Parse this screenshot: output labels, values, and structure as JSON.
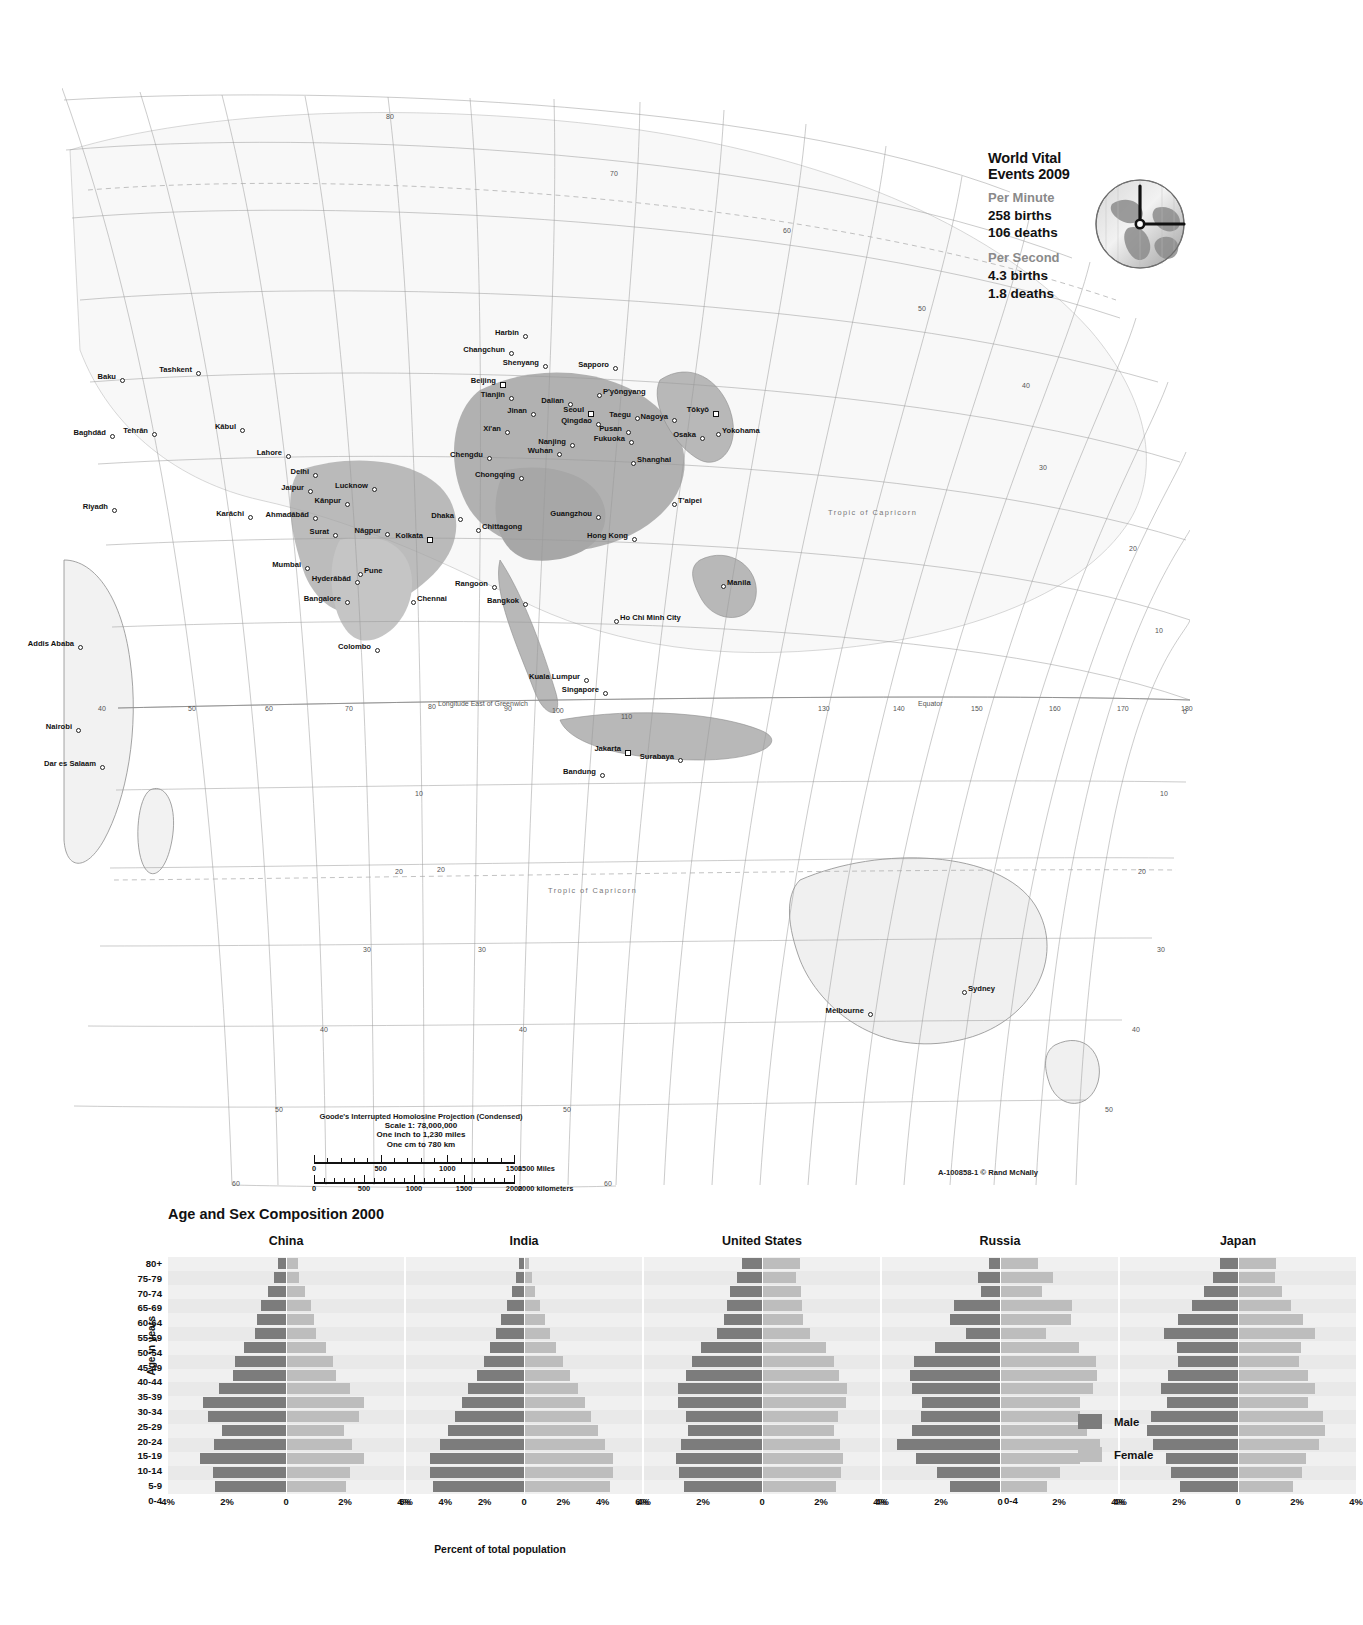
{
  "vital_events": {
    "title": "World Vital Events 2009",
    "groups": [
      {
        "heading": "Per Minute",
        "lines": [
          "258 births",
          "106 deaths"
        ]
      },
      {
        "heading": "Per Second",
        "lines": [
          "4.3 births",
          "1.8 deaths"
        ]
      }
    ],
    "globe_icon": "globe-clock-icon"
  },
  "map": {
    "projection_note": "Goode's Interrupted Homolosine Projection (Condensed)",
    "scale_lines": [
      "Scale 1: 78,000,000",
      "One inch to 1,230 miles",
      "One cm to 780 km"
    ],
    "ruler_miles": {
      "labels": [
        "0",
        "500",
        "1000",
        "1500"
      ],
      "unit": "1500 Miles"
    },
    "ruler_km": {
      "labels": [
        "0",
        "500",
        "1000",
        "1500",
        "2000"
      ],
      "unit": "2000 kilometers"
    },
    "credit_code": "A-100858-1",
    "credit_publisher": "Rand McNally",
    "longitude_label": "Longitude East of Greenwich",
    "equator_label": "Equator",
    "tropic_capricorn_label": "Tropic  of  Capricorn",
    "tropic_cancer_label": "Tropic  of  Capricorn",
    "cities": [
      {
        "name": "Baku",
        "x": 120,
        "y": 378,
        "anchor": "right",
        "marker": "dot"
      },
      {
        "name": "Tashkent",
        "x": 196,
        "y": 371,
        "anchor": "right",
        "marker": "dot"
      },
      {
        "name": "Tehrān",
        "x": 152,
        "y": 432,
        "anchor": "right",
        "marker": "dot"
      },
      {
        "name": "Baghdād",
        "x": 110,
        "y": 434,
        "anchor": "right",
        "marker": "dot"
      },
      {
        "name": "Kābul",
        "x": 240,
        "y": 428,
        "anchor": "right",
        "marker": "dot"
      },
      {
        "name": "Riyadh",
        "x": 112,
        "y": 508,
        "anchor": "right",
        "marker": "dot"
      },
      {
        "name": "Karāchi",
        "x": 248,
        "y": 515,
        "anchor": "right",
        "marker": "dot"
      },
      {
        "name": "Lahore",
        "x": 286,
        "y": 454,
        "anchor": "right",
        "marker": "dot"
      },
      {
        "name": "Delhi",
        "x": 313,
        "y": 473,
        "anchor": "right",
        "marker": "dot"
      },
      {
        "name": "Jaipur",
        "x": 308,
        "y": 489,
        "anchor": "right",
        "marker": "dot"
      },
      {
        "name": "Lucknow",
        "x": 372,
        "y": 487,
        "anchor": "right",
        "marker": "dot"
      },
      {
        "name": "Kānpur",
        "x": 345,
        "y": 502,
        "anchor": "right",
        "marker": "dot"
      },
      {
        "name": "Ahmadābād",
        "x": 313,
        "y": 516,
        "anchor": "right",
        "marker": "dot"
      },
      {
        "name": "Surat",
        "x": 333,
        "y": 533,
        "anchor": "right",
        "marker": "dot"
      },
      {
        "name": "Nāgpur",
        "x": 385,
        "y": 532,
        "anchor": "right",
        "marker": "dot"
      },
      {
        "name": "Kolkata",
        "x": 427,
        "y": 537,
        "anchor": "right",
        "marker": "square"
      },
      {
        "name": "Dhaka",
        "x": 458,
        "y": 517,
        "anchor": "right",
        "marker": "dot"
      },
      {
        "name": "Chittagong",
        "x": 476,
        "y": 528,
        "anchor": "left",
        "marker": "dot"
      },
      {
        "name": "Mumbai",
        "x": 305,
        "y": 566,
        "anchor": "right",
        "marker": "dot"
      },
      {
        "name": "Pune",
        "x": 358,
        "y": 572,
        "anchor": "left",
        "marker": "dot"
      },
      {
        "name": "Hyderābād",
        "x": 355,
        "y": 580,
        "anchor": "right",
        "marker": "dot"
      },
      {
        "name": "Bangalore",
        "x": 345,
        "y": 600,
        "anchor": "right",
        "marker": "dot"
      },
      {
        "name": "Chennai",
        "x": 411,
        "y": 600,
        "anchor": "left",
        "marker": "dot"
      },
      {
        "name": "Colombo",
        "x": 375,
        "y": 648,
        "anchor": "right",
        "marker": "dot"
      },
      {
        "name": "Harbin",
        "x": 523,
        "y": 334,
        "anchor": "right",
        "marker": "dot"
      },
      {
        "name": "Changchun",
        "x": 509,
        "y": 351,
        "anchor": "right",
        "marker": "dot"
      },
      {
        "name": "Shenyang",
        "x": 543,
        "y": 364,
        "anchor": "right",
        "marker": "dot"
      },
      {
        "name": "Sapporo",
        "x": 613,
        "y": 366,
        "anchor": "right",
        "marker": "dot"
      },
      {
        "name": "Beijing",
        "x": 500,
        "y": 382,
        "anchor": "right",
        "marker": "square"
      },
      {
        "name": "Tianjin",
        "x": 509,
        "y": 396,
        "anchor": "right",
        "marker": "dot"
      },
      {
        "name": "Dalian",
        "x": 568,
        "y": 402,
        "anchor": "right",
        "marker": "dot"
      },
      {
        "name": "P'yŏngyang",
        "x": 597,
        "y": 393,
        "anchor": "left",
        "marker": "dot"
      },
      {
        "name": "Jinan",
        "x": 531,
        "y": 412,
        "anchor": "right",
        "marker": "dot"
      },
      {
        "name": "Seoul",
        "x": 588,
        "y": 411,
        "anchor": "right",
        "marker": "square"
      },
      {
        "name": "Qingdao",
        "x": 596,
        "y": 422,
        "anchor": "right",
        "marker": "dot"
      },
      {
        "name": "Taegu",
        "x": 635,
        "y": 416,
        "anchor": "right",
        "marker": "dot"
      },
      {
        "name": "Nagoya",
        "x": 672,
        "y": 418,
        "anchor": "right",
        "marker": "dot"
      },
      {
        "name": "Tōkyō",
        "x": 713,
        "y": 411,
        "anchor": "right",
        "marker": "square"
      },
      {
        "name": "Pusan",
        "x": 626,
        "y": 430,
        "anchor": "right",
        "marker": "dot"
      },
      {
        "name": "Fukuoka",
        "x": 629,
        "y": 440,
        "anchor": "right",
        "marker": "dot"
      },
      {
        "name": "Osaka",
        "x": 700,
        "y": 436,
        "anchor": "right",
        "marker": "dot"
      },
      {
        "name": "Yokohama",
        "x": 716,
        "y": 432,
        "anchor": "left",
        "marker": "dot"
      },
      {
        "name": "Xi'an",
        "x": 505,
        "y": 430,
        "anchor": "right",
        "marker": "dot"
      },
      {
        "name": "Nanjing",
        "x": 570,
        "y": 443,
        "anchor": "right",
        "marker": "dot"
      },
      {
        "name": "Chengdu",
        "x": 487,
        "y": 456,
        "anchor": "right",
        "marker": "dot"
      },
      {
        "name": "Wuhan",
        "x": 557,
        "y": 452,
        "anchor": "right",
        "marker": "dot"
      },
      {
        "name": "Shanghai",
        "x": 631,
        "y": 461,
        "anchor": "left",
        "marker": "dot"
      },
      {
        "name": "Chongqing",
        "x": 519,
        "y": 476,
        "anchor": "right",
        "marker": "dot"
      },
      {
        "name": "Guangzhou",
        "x": 596,
        "y": 515,
        "anchor": "right",
        "marker": "dot"
      },
      {
        "name": "T'aipei",
        "x": 672,
        "y": 502,
        "anchor": "left",
        "marker": "dot"
      },
      {
        "name": "Hong Kong",
        "x": 632,
        "y": 537,
        "anchor": "right",
        "marker": "dot"
      },
      {
        "name": "Rangoon",
        "x": 492,
        "y": 585,
        "anchor": "right",
        "marker": "dot"
      },
      {
        "name": "Bangkok",
        "x": 523,
        "y": 602,
        "anchor": "right",
        "marker": "dot"
      },
      {
        "name": "Ho Chi Minh City",
        "x": 614,
        "y": 619,
        "anchor": "left",
        "marker": "dot"
      },
      {
        "name": "Manila",
        "x": 721,
        "y": 584,
        "anchor": "left",
        "marker": "dot"
      },
      {
        "name": "Kuala Lumpur",
        "x": 584,
        "y": 678,
        "anchor": "right",
        "marker": "dot"
      },
      {
        "name": "Singapore",
        "x": 603,
        "y": 691,
        "anchor": "right",
        "marker": "dot"
      },
      {
        "name": "Jakarta",
        "x": 625,
        "y": 750,
        "anchor": "right",
        "marker": "square"
      },
      {
        "name": "Bandung",
        "x": 600,
        "y": 773,
        "anchor": "right",
        "marker": "dot"
      },
      {
        "name": "Surabaya",
        "x": 678,
        "y": 758,
        "anchor": "right",
        "marker": "dot"
      },
      {
        "name": "Addis Ababa",
        "x": 78,
        "y": 645,
        "anchor": "right",
        "marker": "dot"
      },
      {
        "name": "Nairobi",
        "x": 76,
        "y": 728,
        "anchor": "right",
        "marker": "dot"
      },
      {
        "name": "Dar es Salaam",
        "x": 100,
        "y": 765,
        "anchor": "right",
        "marker": "dot"
      },
      {
        "name": "Sydney",
        "x": 962,
        "y": 990,
        "anchor": "left",
        "marker": "dot"
      },
      {
        "name": "Melbourne",
        "x": 868,
        "y": 1012,
        "anchor": "right",
        "marker": "dot"
      }
    ],
    "graticule_labels": [
      {
        "text": "80",
        "x": 386,
        "y": 113
      },
      {
        "text": "70",
        "x": 610,
        "y": 170
      },
      {
        "text": "60",
        "x": 783,
        "y": 227
      },
      {
        "text": "50",
        "x": 918,
        "y": 305
      },
      {
        "text": "40",
        "x": 1022,
        "y": 382
      },
      {
        "text": "30",
        "x": 1039,
        "y": 464
      },
      {
        "text": "20",
        "x": 1129,
        "y": 545
      },
      {
        "text": "10",
        "x": 1155,
        "y": 627
      },
      {
        "text": "0",
        "x": 1183,
        "y": 708
      },
      {
        "text": "10",
        "x": 1160,
        "y": 790
      },
      {
        "text": "20",
        "x": 1138,
        "y": 868
      },
      {
        "text": "30",
        "x": 1157,
        "y": 946
      },
      {
        "text": "40",
        "x": 1132,
        "y": 1026
      },
      {
        "text": "50",
        "x": 1105,
        "y": 1106
      },
      {
        "text": "40",
        "x": 98,
        "y": 705
      },
      {
        "text": "50",
        "x": 188,
        "y": 705
      },
      {
        "text": "60",
        "x": 265,
        "y": 705
      },
      {
        "text": "70",
        "x": 345,
        "y": 705
      },
      {
        "text": "80",
        "x": 428,
        "y": 703
      },
      {
        "text": "90",
        "x": 504,
        "y": 705
      },
      {
        "text": "100",
        "x": 552,
        "y": 707
      },
      {
        "text": "110",
        "x": 621,
        "y": 713
      },
      {
        "text": "130",
        "x": 818,
        "y": 705
      },
      {
        "text": "140",
        "x": 893,
        "y": 705
      },
      {
        "text": "150",
        "x": 971,
        "y": 705
      },
      {
        "text": "160",
        "x": 1049,
        "y": 705
      },
      {
        "text": "170",
        "x": 1117,
        "y": 705
      },
      {
        "text": "180",
        "x": 1181,
        "y": 705
      },
      {
        "text": "10",
        "x": 415,
        "y": 790
      },
      {
        "text": "20",
        "x": 395,
        "y": 868
      },
      {
        "text": "20",
        "x": 437,
        "y": 866
      },
      {
        "text": "30",
        "x": 363,
        "y": 946
      },
      {
        "text": "30",
        "x": 478,
        "y": 946
      },
      {
        "text": "40",
        "x": 320,
        "y": 1026
      },
      {
        "text": "40",
        "x": 519,
        "y": 1026
      },
      {
        "text": "50",
        "x": 275,
        "y": 1106
      },
      {
        "text": "50",
        "x": 563,
        "y": 1106
      },
      {
        "text": "60",
        "x": 232,
        "y": 1180
      },
      {
        "text": "60",
        "x": 604,
        "y": 1180
      }
    ]
  },
  "chart_data": {
    "type": "bar",
    "title": "Age and Sex Composition 2000",
    "xlabel": "Percent of total population",
    "ylabel": "Age in years",
    "legend": [
      {
        "label": "Male",
        "color": "#7c7c7c"
      },
      {
        "label": "Female",
        "color": "#bdbdbd"
      }
    ],
    "legend_position": "right",
    "categories": [
      "80+",
      "75-79",
      "70-74",
      "65-69",
      "60-64",
      "55-59",
      "50-54",
      "45-49",
      "40-44",
      "35-39",
      "30-34",
      "25-29",
      "20-24",
      "15-19",
      "10-14",
      "5-9",
      "0-4"
    ],
    "panels": [
      {
        "name": "China",
        "xticks": [
          "4%",
          "2%",
          "0",
          "2%",
          "4%"
        ],
        "xlim": 5.0,
        "series": [
          {
            "name": "Male",
            "values": [
              0.35,
              0.5,
              0.75,
              1.05,
              1.25,
              1.3,
              1.8,
              2.15,
              2.25,
              2.85,
              3.5,
              3.3,
              2.7,
              3.05,
              3.65,
              3.1,
              3.0
            ]
          },
          {
            "name": "Female",
            "values": [
              0.5,
              0.55,
              0.8,
              1.05,
              1.2,
              1.25,
              1.7,
              2.0,
              2.1,
              2.7,
              3.3,
              3.1,
              2.45,
              2.8,
              3.3,
              2.7,
              2.55
            ]
          }
        ]
      },
      {
        "name": "India",
        "xticks": [
          "6%",
          "4%",
          "2%",
          "0",
          "2%",
          "4%",
          "6%"
        ],
        "xlim": 7.0,
        "series": [
          {
            "name": "Male",
            "values": [
              0.3,
              0.45,
              0.7,
              1.0,
              1.35,
              1.65,
              2.0,
              2.4,
              2.8,
              3.3,
              3.7,
              4.1,
              4.5,
              5.0,
              5.6,
              5.6,
              5.4
            ]
          },
          {
            "name": "Female",
            "values": [
              0.3,
              0.45,
              0.65,
              0.95,
              1.25,
              1.55,
              1.9,
              2.3,
              2.7,
              3.2,
              3.6,
              4.0,
              4.4,
              4.8,
              5.3,
              5.3,
              5.1
            ]
          }
        ]
      },
      {
        "name": "United States",
        "xticks": [
          "4%",
          "2%",
          "0",
          "2%",
          "4%"
        ],
        "xlim": 5.0,
        "series": [
          {
            "name": "Male",
            "values": [
              0.85,
              1.05,
              1.35,
              1.5,
              1.6,
              1.9,
              2.6,
              2.95,
              3.2,
              3.55,
              3.55,
              3.2,
              3.15,
              3.45,
              3.65,
              3.5,
              3.3
            ]
          },
          {
            "name": "Female",
            "values": [
              1.6,
              1.45,
              1.65,
              1.7,
              1.75,
              2.05,
              2.7,
              3.05,
              3.25,
              3.6,
              3.55,
              3.2,
              3.05,
              3.3,
              3.45,
              3.35,
              3.15
            ]
          }
        ]
      },
      {
        "name": "Russia",
        "xticks": [
          "4%",
          "2%",
          "0",
          "2%",
          "4%"
        ],
        "xlim": 5.0,
        "series": [
          {
            "name": "Male",
            "values": [
              0.45,
              0.95,
              0.8,
              1.95,
              2.1,
              1.45,
              2.75,
              3.65,
              3.8,
              3.75,
              3.3,
              3.35,
              3.75,
              4.35,
              3.55,
              2.65,
              2.1
            ]
          },
          {
            "name": "Female",
            "values": [
              1.6,
              2.25,
              1.8,
              3.05,
              3.0,
              1.95,
              3.35,
              4.05,
              4.1,
              3.95,
              3.4,
              3.4,
              3.7,
              4.25,
              3.4,
              2.55,
              2.0
            ]
          }
        ]
      },
      {
        "name": "Japan",
        "xticks": [
          "4%",
          "2%",
          "0",
          "2%",
          "4%"
        ],
        "xlim": 5.0,
        "series": [
          {
            "name": "Male",
            "values": [
              0.75,
              1.05,
              1.45,
              1.95,
              2.55,
              3.15,
              2.6,
              2.55,
              2.95,
              3.25,
              3.0,
              3.7,
              3.85,
              3.6,
              3.05,
              2.85,
              2.45
            ]
          },
          {
            "name": "Female",
            "values": [
              1.6,
              1.55,
              1.85,
              2.25,
              2.75,
              3.25,
              2.65,
              2.6,
              2.95,
              3.25,
              2.95,
              3.6,
              3.7,
              3.45,
              2.9,
              2.7,
              2.35
            ]
          }
        ]
      }
    ]
  }
}
